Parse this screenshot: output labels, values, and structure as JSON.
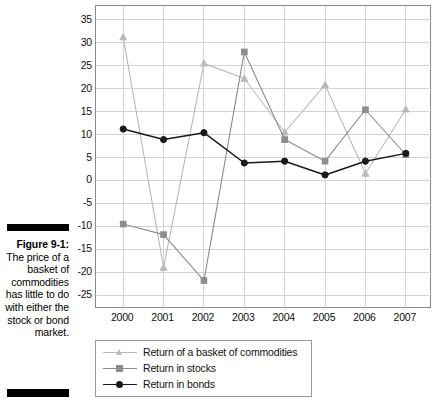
{
  "figure": {
    "caption_label": "Figure 9-1:",
    "caption_body": "The price of a basket of commodities has little to do with either the stock or bond market."
  },
  "chart_data": {
    "type": "line",
    "title": "",
    "xlabel": "",
    "ylabel": "",
    "categories": [
      "2000",
      "2001",
      "2002",
      "2003",
      "2004",
      "2005",
      "2006",
      "2007"
    ],
    "ylim": [
      -28,
      38
    ],
    "yticks": [
      35,
      30,
      25,
      20,
      15,
      10,
      5,
      0,
      -5,
      -10,
      -15,
      -20,
      -25
    ],
    "ytick_labels": [
      "35",
      "30",
      "25",
      "20",
      "15",
      "10",
      "5",
      "0",
      "-5",
      "-10",
      "-15",
      "-20",
      "-25"
    ],
    "grid": true,
    "legend_position": "below-left",
    "series": [
      {
        "name": "Return of a basket of commodities",
        "color": "#b9b9b9",
        "marker": "triangle",
        "values": [
          31.2,
          -19.0,
          25.5,
          22.2,
          10.5,
          20.8,
          1.5,
          15.5
        ]
      },
      {
        "name": "Return in stocks",
        "color": "#8c8c8c",
        "marker": "square",
        "values": [
          -9.5,
          -11.8,
          -21.8,
          28.0,
          8.9,
          4.2,
          15.4,
          5.6
        ]
      },
      {
        "name": "Return in bonds",
        "color": "#1a1a1a",
        "marker": "circle",
        "values": [
          11.2,
          8.9,
          10.4,
          3.8,
          4.2,
          1.2,
          4.2,
          5.9
        ]
      }
    ]
  },
  "colors": {
    "grid": "#d4d4d4",
    "frame": "#8a8a8a",
    "text": "#111111",
    "rule": "#000000"
  }
}
